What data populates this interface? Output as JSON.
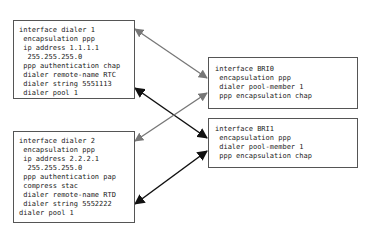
{
  "diagram": {
    "boxes": [
      {
        "id": "dialer1",
        "lines": [
          "interface dialer 1",
          " encapsulation ppp",
          " ip address 1.1.1.1",
          "  255.255.255.0",
          " ppp authentication chap",
          " dialer remote-name RTC",
          " dialer string 5551113",
          " dialer pool 1"
        ]
      },
      {
        "id": "dialer2",
        "lines": [
          "interface dialer 2",
          " encapsulation ppp",
          " ip address 2.2.2.1",
          "  255.255.255.0",
          " ppp authentication pap",
          " compress stac",
          " dialer remote-name RTD",
          " dialer string 5552222",
          "dialer pool 1"
        ]
      },
      {
        "id": "bri0",
        "lines": [
          "interface BRI0",
          " encapsulation ppp",
          " dialer pool-member 1",
          " ppp encapsulation chap"
        ]
      },
      {
        "id": "bri1",
        "lines": [
          "interface BRI1",
          " encapsulation ppp",
          " dialer pool-member 1",
          " ppp encapsulation chap"
        ]
      }
    ],
    "connections": [
      {
        "from": "dialer1",
        "to": "bri0",
        "color": "#777777"
      },
      {
        "from": "dialer1",
        "to": "bri1",
        "color": "#111111"
      },
      {
        "from": "dialer2",
        "to": "bri0",
        "color": "#777777"
      },
      {
        "from": "dialer2",
        "to": "bri1",
        "color": "#111111"
      }
    ],
    "colors": {
      "gray_arrow": "#777777",
      "black_arrow": "#111111",
      "border": "#555555"
    }
  }
}
